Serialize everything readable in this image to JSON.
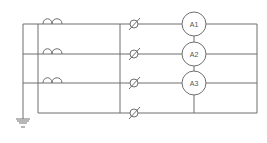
{
  "diagram": {
    "type": "electrical-schematic",
    "colors": {
      "line": "#6f6f6f",
      "text": "#555555",
      "background": "#ffffff"
    },
    "rows": [
      {
        "y": 24,
        "has_coil": true,
        "meter": "A1"
      },
      {
        "y": 54,
        "has_coil": true,
        "meter": "A2"
      },
      {
        "y": 83,
        "has_coil": true,
        "meter": "A3"
      },
      {
        "y": 113,
        "has_coil": false,
        "meter": null
      }
    ],
    "meters": [
      {
        "label": "A1"
      },
      {
        "label": "A2"
      },
      {
        "label": "A3"
      }
    ],
    "terminals_count": 4,
    "coils_count": 3,
    "ground_symbol": "ground-icon"
  }
}
